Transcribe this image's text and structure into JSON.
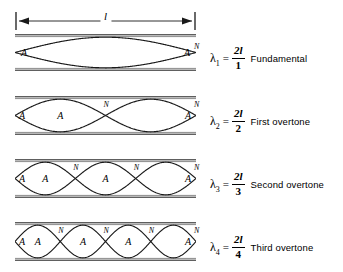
{
  "figure": {
    "dimension": {
      "label": "l",
      "name": "string-length"
    },
    "node_symbol": "N",
    "antinode_symbol": "A",
    "rows": [
      {
        "id": "fundamental",
        "loops": 1,
        "lambda_symbol": "λ",
        "lambda_sub": "1",
        "equals": "=",
        "numerator": "2l",
        "denominator": "1",
        "name": "Fundamental",
        "antinodes": 2,
        "nodes": 1
      },
      {
        "id": "first-overtone",
        "loops": 2,
        "lambda_symbol": "λ",
        "lambda_sub": "2",
        "equals": "=",
        "numerator": "2l",
        "denominator": "2",
        "name": "First overtone",
        "antinodes": 3,
        "nodes": 2
      },
      {
        "id": "second-overtone",
        "loops": 3,
        "lambda_symbol": "λ",
        "lambda_sub": "3",
        "equals": "=",
        "numerator": "2l",
        "denominator": "3",
        "name": "Second overtone",
        "antinodes": 4,
        "nodes": 3
      },
      {
        "id": "third-overtone",
        "loops": 4,
        "lambda_symbol": "λ",
        "lambda_sub": "4",
        "equals": "=",
        "numerator": "2l",
        "denominator": "4",
        "name": "Third overtone",
        "antinodes": 5,
        "nodes": 4
      }
    ],
    "colors": {
      "ink": "#1a1a1a",
      "rail": "#8a8a8a",
      "background": "#ffffff"
    }
  }
}
